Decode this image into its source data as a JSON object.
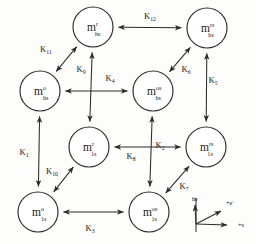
{
  "figure": {
    "type": "kinetic-scheme-cube-diagram",
    "ink_color": "#2b2b2b",
    "background_color": "#fdfdfc"
  },
  "nodes": [
    {
      "id": "m-r-hs",
      "base": "m",
      "sup": "r",
      "sub": "hs",
      "cx": 93,
      "cy": 27,
      "r": 20
    },
    {
      "id": "m-rs-hs",
      "base": "m",
      "sup": "rs",
      "sub": "hs",
      "cx": 207,
      "cy": 28,
      "r": 20
    },
    {
      "id": "m-o-hs",
      "base": "m",
      "sup": "o",
      "sub": "hs",
      "cx": 40,
      "cy": 91,
      "r": 20
    },
    {
      "id": "m-os-hs",
      "base": "m",
      "sup": "os",
      "sub": "hs",
      "cx": 153,
      "cy": 91,
      "r": 20
    },
    {
      "id": "m-r-1s",
      "base": "m",
      "sup": "r",
      "sub": "1s",
      "cx": 89,
      "cy": 147,
      "r": 20
    },
    {
      "id": "m-rs-1s",
      "base": "m",
      "sup": "rs",
      "sub": "1s",
      "cx": 206,
      "cy": 147,
      "r": 20
    },
    {
      "id": "m-o-1s",
      "base": "m",
      "sup": "o",
      "sub": "1s",
      "cx": 38,
      "cy": 212,
      "r": 20
    },
    {
      "id": "m-os-1s",
      "base": "m",
      "sup": "os",
      "sub": "1s",
      "cx": 149,
      "cy": 212,
      "r": 20
    }
  ],
  "edges": [
    {
      "id": "k1",
      "base": "K",
      "sub": "1",
      "from": "m-o-hs",
      "to": "m-o-1s",
      "label_x": 24,
      "label_y": 155
    },
    {
      "id": "k2",
      "base": "K",
      "sub": "2",
      "from": "m-os-hs",
      "to": "m-os-1s",
      "label_x": 160,
      "label_y": 148
    },
    {
      "id": "k3",
      "base": "K",
      "sub": "3",
      "from": "m-o-1s",
      "to": "m-os-1s",
      "label_x": 90,
      "label_y": 231
    },
    {
      "id": "k4",
      "base": "K",
      "sub": "4",
      "from": "m-o-hs",
      "to": "m-os-hs",
      "label_x": 110,
      "label_y": 81
    },
    {
      "id": "k5",
      "base": "K",
      "sub": "5",
      "from": "m-rs-hs",
      "to": "m-rs-1s",
      "label_x": 213,
      "label_y": 83
    },
    {
      "id": "k6",
      "base": "K",
      "sub": "6",
      "from": "m-os-hs",
      "to": "m-rs-hs",
      "label_x": 186,
      "label_y": 72
    },
    {
      "id": "k7",
      "base": "K",
      "sub": "7",
      "from": "m-os-1s",
      "to": "m-rs-1s",
      "label_x": 184,
      "label_y": 189
    },
    {
      "id": "k8",
      "base": "K",
      "sub": "8",
      "from": "m-rs-1s",
      "to": "m-r-1s",
      "label_x": 131,
      "label_y": 159
    },
    {
      "id": "k9",
      "base": "K",
      "sub": "9",
      "from": "m-r-1s",
      "to": "m-r-hs",
      "label_x": 81,
      "label_y": 72
    },
    {
      "id": "k10",
      "base": "K",
      "sub": "10",
      "from": "m-r-1s",
      "to": "m-o-1s",
      "label_x": 52,
      "label_y": 174
    },
    {
      "id": "k11",
      "base": "K",
      "sub": "11",
      "from": "m-o-hs",
      "to": "m-r-hs",
      "label_x": 46,
      "label_y": 52
    },
    {
      "id": "k12",
      "base": "K",
      "sub": "12",
      "from": "m-r-hs",
      "to": "m-rs-hs",
      "label_x": 150,
      "label_y": 19
    }
  ],
  "legend": {
    "id": "axis-legend",
    "origin_x": 196,
    "origin_y": 232,
    "axes": [
      {
        "id": "axis-hs",
        "label": "hs",
        "sup": "",
        "label_x": 192,
        "label_y": 201
      },
      {
        "id": "axis-electron",
        "label": "+e",
        "sup": "-",
        "label_x": 226,
        "label_y": 205
      },
      {
        "id": "axis-s",
        "label": "+s",
        "sup": "",
        "label_x": 238,
        "label_y": 227
      }
    ]
  }
}
